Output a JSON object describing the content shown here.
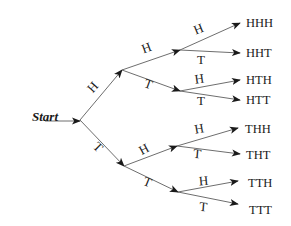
{
  "diagram": {
    "type": "probability-tree",
    "root": {
      "label": "Start",
      "x": 80,
      "y": 120
    },
    "start_arrow": {
      "x1": 45,
      "y1": 121,
      "x2": 80,
      "y2": 121
    },
    "nodes": {
      "H": {
        "x": 122,
        "y": 70
      },
      "T": {
        "x": 124,
        "y": 166
      },
      "HH": {
        "x": 180,
        "y": 50
      },
      "HT": {
        "x": 180,
        "y": 91
      },
      "TH": {
        "x": 177,
        "y": 146
      },
      "TT": {
        "x": 178,
        "y": 192
      }
    },
    "edges": [
      {
        "from": "root",
        "to": "H",
        "label": "H",
        "lx": 96,
        "ly": 90,
        "rot": -48
      },
      {
        "from": "root",
        "to": "T",
        "label": "T",
        "lx": 95,
        "ly": 150,
        "rot": 45
      },
      {
        "from": "H",
        "to": "HH",
        "label": "H",
        "lx": 148,
        "ly": 52,
        "rot": -20
      },
      {
        "from": "H",
        "to": "HT",
        "label": "T",
        "lx": 147,
        "ly": 88,
        "rot": 20
      },
      {
        "from": "T",
        "to": "TH",
        "label": "H",
        "lx": 146,
        "ly": 153,
        "rot": -28
      },
      {
        "from": "T",
        "to": "TT",
        "label": "T",
        "lx": 146,
        "ly": 186,
        "rot": 22
      },
      {
        "from": "HH",
        "to": "HHH",
        "label": "H",
        "lx": 200,
        "ly": 33,
        "rot": -22
      },
      {
        "from": "HH",
        "to": "HHT",
        "label": "T",
        "lx": 201,
        "ly": 64,
        "rot": 0
      },
      {
        "from": "HT",
        "to": "HTH",
        "label": "H",
        "lx": 200,
        "ly": 83,
        "rot": -8
      },
      {
        "from": "HT",
        "to": "HTT",
        "label": "T",
        "lx": 201,
        "ly": 105,
        "rot": 0
      },
      {
        "from": "TH",
        "to": "THH",
        "label": "H",
        "lx": 200,
        "ly": 133,
        "rot": -10
      },
      {
        "from": "TH",
        "to": "THT",
        "label": "T",
        "lx": 197,
        "ly": 158,
        "rot": 5
      },
      {
        "from": "TT",
        "to": "TTH",
        "label": "H",
        "lx": 204,
        "ly": 185,
        "rot": -5
      },
      {
        "from": "TT",
        "to": "TTT",
        "label": "T",
        "lx": 203,
        "ly": 211,
        "rot": 5
      }
    ],
    "leaves": [
      {
        "id": "HHH",
        "label": "HHH",
        "ax": 240,
        "ay": 23,
        "tx": 246,
        "ty": 27
      },
      {
        "id": "HHT",
        "label": "HHT",
        "ax": 240,
        "ay": 53,
        "tx": 246,
        "ty": 57
      },
      {
        "id": "HTH",
        "label": "HTH",
        "ax": 240,
        "ay": 80,
        "tx": 246,
        "ty": 84
      },
      {
        "id": "HTT",
        "label": "HTT",
        "ax": 240,
        "ay": 100,
        "tx": 246,
        "ty": 104
      },
      {
        "id": "THH",
        "label": "THH",
        "ax": 238,
        "ay": 128,
        "tx": 245,
        "ty": 133
      },
      {
        "id": "THT",
        "label": "THT",
        "ax": 240,
        "ay": 154,
        "tx": 246,
        "ty": 159
      },
      {
        "id": "TTH",
        "label": "TTH",
        "ax": 238,
        "ay": 181,
        "tx": 248,
        "ty": 187
      },
      {
        "id": "TTT",
        "label": "TTT",
        "ax": 238,
        "ay": 204,
        "tx": 249,
        "ty": 214
      }
    ],
    "colors": {
      "line": "#6e6e6e",
      "arrow": "#1a1a1a",
      "text": "#1a1a1a",
      "background": "#ffffff"
    }
  }
}
